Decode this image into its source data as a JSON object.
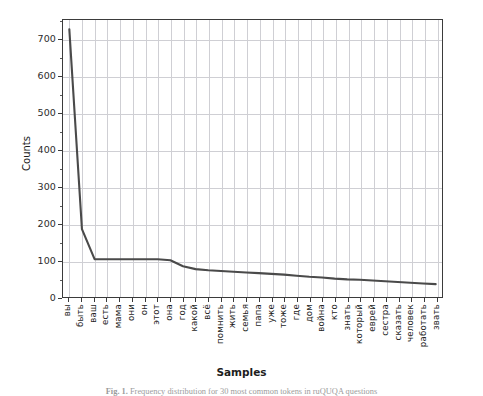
{
  "figure": {
    "caption_prefix": "Fig. 1.",
    "caption_text": "Frequency distribution for 30 most common tokens in ruQUQA questions"
  },
  "axes": {
    "ylabel": "Counts",
    "xlabel": "Samples",
    "yticks": [
      "0",
      "100",
      "200",
      "300",
      "400",
      "500",
      "600",
      "700"
    ],
    "line_color": "#4a4a4a",
    "grid_color": "#cfcfd4",
    "axis_color": "#3b3b3b"
  },
  "chart_data": {
    "type": "line",
    "title": "",
    "xlabel": "Samples",
    "ylabel": "Counts",
    "ylim": [
      0,
      755
    ],
    "yticks": [
      0,
      100,
      200,
      300,
      400,
      500,
      600,
      700
    ],
    "grid": true,
    "legend": "none",
    "categories": [
      "вы",
      "быть",
      "ваш",
      "есть",
      "мама",
      "они",
      "он",
      "этот",
      "она",
      "год",
      "какой",
      "всё",
      "помнить",
      "жить",
      "семья",
      "папа",
      "уже",
      "тоже",
      "где",
      "дом",
      "война",
      "кто",
      "знать",
      "который",
      "еврей",
      "сестра",
      "сказать",
      "человек",
      "работать",
      "звать"
    ],
    "values": [
      730,
      185,
      103,
      103,
      103,
      103,
      103,
      103,
      100,
      84,
      76,
      73,
      71,
      69,
      67,
      65,
      63,
      61,
      58,
      55,
      53,
      50,
      48,
      47,
      45,
      43,
      41,
      39,
      37,
      35
    ],
    "series": [
      {
        "name": "token counts",
        "values": [
          730,
          185,
          103,
          103,
          103,
          103,
          103,
          103,
          100,
          84,
          76,
          73,
          71,
          69,
          67,
          65,
          63,
          61,
          58,
          55,
          53,
          50,
          48,
          47,
          45,
          43,
          41,
          39,
          37,
          35
        ]
      }
    ]
  }
}
